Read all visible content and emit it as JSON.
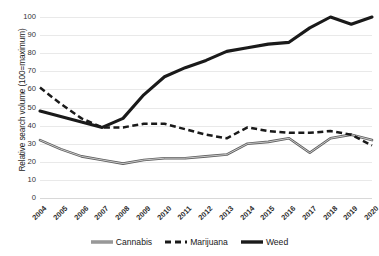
{
  "chart_data": {
    "type": "line",
    "title": "",
    "xlabel": "",
    "ylabel": "Relative search volume (100=maximum)",
    "ylim": [
      0,
      100
    ],
    "ytick_step": 10,
    "grid": true,
    "legend_position": "bottom",
    "categories": [
      "2004",
      "2005",
      "2006",
      "2007",
      "2008",
      "2009",
      "2010",
      "2011",
      "2012",
      "2013",
      "2014",
      "2015",
      "2016",
      "2017",
      "2018",
      "2019",
      "2020"
    ],
    "yticks": [
      "0",
      "10",
      "20",
      "30",
      "40",
      "50",
      "60",
      "70",
      "80",
      "90",
      "100"
    ],
    "series": [
      {
        "name": "Cannabis",
        "style": "thin-double-solid",
        "color": "#808080",
        "values": [
          32,
          27,
          23,
          21,
          19,
          21,
          22,
          22,
          23,
          24,
          30,
          31,
          33,
          25,
          33,
          35,
          32
        ]
      },
      {
        "name": "Marijuana",
        "style": "dashed",
        "color": "#1a1a1a",
        "values": [
          61,
          52,
          44,
          39,
          39,
          41,
          41,
          38,
          35,
          33,
          39,
          37,
          36,
          36,
          37,
          35,
          29
        ]
      },
      {
        "name": "Weed",
        "style": "thick-solid",
        "color": "#1a1a1a",
        "values": [
          48,
          45,
          42,
          39,
          44,
          57,
          67,
          72,
          76,
          81,
          83,
          85,
          86,
          94,
          100,
          96,
          100
        ]
      }
    ]
  },
  "legend": {
    "items": [
      {
        "label": "Cannabis",
        "swatch": "line-thin-gray-icon"
      },
      {
        "label": "Marijuana",
        "swatch": "line-dashed-black-icon"
      },
      {
        "label": "Weed",
        "swatch": "line-thick-black-icon"
      }
    ]
  },
  "colors": {
    "background": "#ffffff",
    "gridline": "#e9e9e9",
    "cannabis": "#808080",
    "marijuana": "#1a1a1a",
    "weed": "#1a1a1a",
    "text": "#1a1a1a"
  }
}
